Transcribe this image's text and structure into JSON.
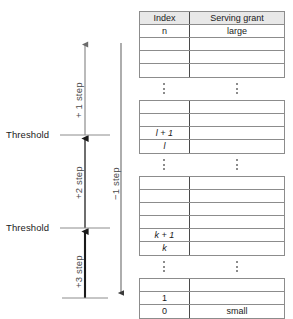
{
  "diagram": {
    "axis": {
      "up_arrow_name": "up-arrow",
      "down_arrow_name": "down-arrow",
      "threshold_labels": [
        "Threshold",
        "Threshold"
      ],
      "step_labels_up": [
        "+ 1 step",
        "+2 step",
        "+3 step"
      ],
      "step_label_down": "−1 step"
    },
    "table": {
      "columns": [
        "Index",
        "Serving grant"
      ],
      "ellipsis": "⋮",
      "blocks": [
        {
          "id": "block-top",
          "rows": [
            {
              "index": "Index",
              "grant": "Serving grant",
              "header": true
            },
            {
              "index": "n",
              "grant": "large"
            },
            {
              "index": "",
              "grant": ""
            },
            {
              "index": "",
              "grant": ""
            },
            {
              "index": "",
              "grant": ""
            }
          ]
        },
        {
          "id": "block-l",
          "rows": [
            {
              "index": "",
              "grant": ""
            },
            {
              "index": "",
              "grant": ""
            },
            {
              "index": "l + 1",
              "grant": "",
              "index_italic": true
            },
            {
              "index": "l",
              "grant": "",
              "index_italic": true
            }
          ]
        },
        {
          "id": "block-k",
          "rows": [
            {
              "index": "",
              "grant": ""
            },
            {
              "index": "",
              "grant": ""
            },
            {
              "index": "",
              "grant": ""
            },
            {
              "index": "",
              "grant": ""
            },
            {
              "index": "k + 1",
              "grant": "",
              "index_italic": true
            },
            {
              "index": "k",
              "grant": "",
              "index_italic": true
            }
          ]
        },
        {
          "id": "block-bottom",
          "rows": [
            {
              "index": "",
              "grant": ""
            },
            {
              "index": "1",
              "grant": ""
            },
            {
              "index": "0",
              "grant": "small"
            }
          ]
        }
      ]
    },
    "colors": {
      "line": "#8c8c8c",
      "axis_light": "#8c8c8c",
      "axis_dark": "#1a1a1a",
      "header_fill": "#e8e8e8",
      "text": "#1a1a1a",
      "label_text": "#4a4a4a"
    }
  }
}
